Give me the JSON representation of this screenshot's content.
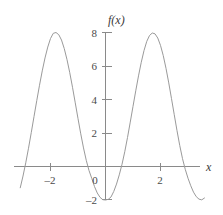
{
  "chart_data": {
    "type": "line",
    "title": "",
    "xlabel": "x",
    "ylabel": "f(x)",
    "xlim": [
      -3.1,
      3.6
    ],
    "ylim": [
      -2.8,
      8.6
    ],
    "grid": false,
    "legend": null,
    "xticks": [
      -2,
      0,
      2
    ],
    "xtick_labels": [
      "–2",
      "0",
      "2"
    ],
    "yticks": [
      -2,
      2,
      4,
      6,
      8
    ],
    "ytick_labels": [
      "–2",
      "2",
      "4",
      "6",
      "8"
    ],
    "series": [
      {
        "name": "f(x)",
        "color": "#9a9a9a",
        "x": [
          -3.1,
          -3.0,
          -2.9,
          -2.8,
          -2.7,
          -2.6,
          -2.5,
          -2.4,
          -2.3,
          -2.2,
          -2.1,
          -2.0,
          -1.9,
          -1.8,
          -1.7,
          -1.6,
          -1.5,
          -1.4,
          -1.3,
          -1.2,
          -1.1,
          -1.0,
          -0.9,
          -0.8,
          -0.7,
          -0.6,
          -0.5,
          -0.4,
          -0.3,
          -0.2,
          -0.1,
          0.0,
          0.1,
          0.2,
          0.3,
          0.4,
          0.5,
          0.6,
          0.7,
          0.8,
          0.9,
          1.0,
          1.1,
          1.2,
          1.3,
          1.4,
          1.5,
          1.6,
          1.7,
          1.8,
          1.9,
          2.0,
          2.1,
          2.2,
          2.3,
          2.4,
          2.5,
          2.6,
          2.7,
          2.8,
          2.9,
          3.0,
          3.1,
          3.2,
          3.3,
          3.4,
          3.5,
          3.6
        ],
        "y": [
          -1.27,
          -0.57,
          0.22,
          1.09,
          2.02,
          2.98,
          3.93,
          4.85,
          5.71,
          6.48,
          7.13,
          7.64,
          7.95,
          8.0,
          7.87,
          7.55,
          7.04,
          6.38,
          5.6,
          4.73,
          3.8,
          2.86,
          1.95,
          1.11,
          0.37,
          -0.24,
          -0.71,
          -1.2,
          -1.58,
          -1.84,
          -1.98,
          -2.0,
          -1.96,
          -1.82,
          -1.49,
          -1.05,
          -0.5,
          0.13,
          0.88,
          1.73,
          2.65,
          3.59,
          4.52,
          5.41,
          6.22,
          6.92,
          7.47,
          7.82,
          7.97,
          7.92,
          7.67,
          7.23,
          6.62,
          5.86,
          4.99,
          4.05,
          3.09,
          2.14,
          1.25,
          0.47,
          -0.17,
          -0.7,
          -1.15,
          -1.53,
          -1.8,
          -1.95,
          -1.99,
          -1.88
        ],
        "peaks": [
          {
            "x": -1.78,
            "y": 8.0
          },
          {
            "x": 1.72,
            "y": 8.0
          }
        ],
        "minima": [
          {
            "x": 0.02,
            "y": -2.0
          },
          {
            "x": 3.48,
            "y": -2.0
          }
        ]
      }
    ]
  }
}
